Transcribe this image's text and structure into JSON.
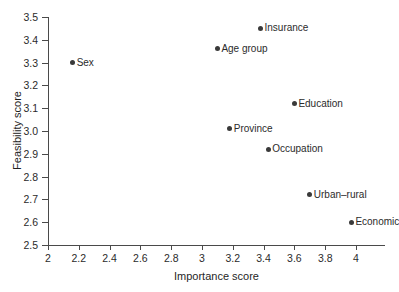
{
  "chart_data": {
    "type": "scatter",
    "title": "",
    "xlabel": "Importance score",
    "ylabel": "Feasibility score",
    "xlim": [
      2,
      4.2
    ],
    "ylim": [
      2.5,
      3.5
    ],
    "grid": false,
    "legend": "none",
    "point_labels_position": "right-of-marker",
    "marker_color": "#3a3a3a",
    "axis_color": "#4a4a4a",
    "xticks": [
      "2",
      "2.2",
      "2.4",
      "2.6",
      "2.8",
      "3",
      "3.2",
      "3.4",
      "3.6",
      "3.8",
      "4"
    ],
    "xtick_values": [
      2,
      2.2,
      2.4,
      2.6,
      2.8,
      3,
      3.2,
      3.4,
      3.6,
      3.8,
      4
    ],
    "yticks": [
      "2.5",
      "2.6",
      "2.7",
      "2.8",
      "2.9",
      "3.0",
      "3.1",
      "3.2",
      "3.3",
      "3.4",
      "3.5"
    ],
    "ytick_values": [
      2.5,
      2.6,
      2.7,
      2.8,
      2.9,
      3.0,
      3.1,
      3.2,
      3.3,
      3.4,
      3.5
    ],
    "points": [
      {
        "label": "Insurance",
        "x": 3.38,
        "y": 3.45
      },
      {
        "label": "Age group",
        "x": 3.1,
        "y": 3.36
      },
      {
        "label": "Sex",
        "x": 2.16,
        "y": 3.3
      },
      {
        "label": "Education",
        "x": 3.6,
        "y": 3.12
      },
      {
        "label": "Province",
        "x": 3.18,
        "y": 3.01
      },
      {
        "label": "Occupation",
        "x": 3.43,
        "y": 2.92
      },
      {
        "label": "Urban–rural",
        "x": 3.7,
        "y": 2.72
      },
      {
        "label": "Economic",
        "x": 3.97,
        "y": 2.6
      }
    ]
  }
}
